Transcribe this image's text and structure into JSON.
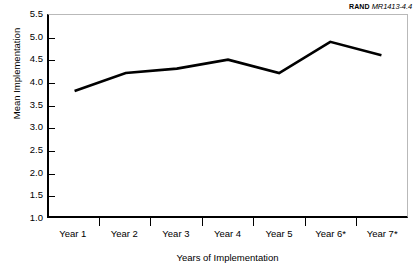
{
  "figure": {
    "identifier_prefix": "RAND",
    "identifier_number": "MR1413-4.4"
  },
  "chart_data": {
    "type": "line",
    "title": "",
    "subtitle": "",
    "xlabel": "Years of Implementation",
    "ylabel": "Mean Implementation",
    "categories": [
      "Year 1",
      "Year 2",
      "Year 3",
      "Year 4",
      "Year 5",
      "Year 6*",
      "Year 7*"
    ],
    "values": [
      3.8,
      4.2,
      4.3,
      4.5,
      4.2,
      4.9,
      4.6
    ],
    "series": [
      {
        "name": "Mean Implementation",
        "values": [
          3.8,
          4.2,
          4.3,
          4.5,
          4.2,
          4.9,
          4.6
        ],
        "color": "#000000"
      }
    ],
    "ylim": [
      1.0,
      5.5
    ],
    "yticks": [
      1.0,
      1.5,
      2.0,
      2.5,
      3.0,
      3.5,
      4.0,
      4.5,
      5.0,
      5.5
    ],
    "ytick_labels": [
      "1.0",
      "1.5",
      "2.0",
      "2.5",
      "3.0",
      "3.5",
      "4.0",
      "4.5",
      "5.0",
      "5.5"
    ],
    "grid": false,
    "legend": false,
    "legend_position": "none",
    "line_color": "#000000",
    "line_width": 2.6,
    "axis_color": "#000000",
    "frame_color": "#b9b9b9",
    "background": "#ffffff",
    "annotations": [
      "* asterisk on Year 6 and Year 7 labels"
    ]
  }
}
